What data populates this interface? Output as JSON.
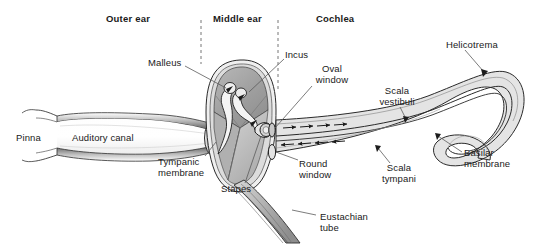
{
  "figure": {
    "type": "anatomical-diagram",
    "background_color": "#ffffff",
    "text_color": "#1a1a1a",
    "fill_light": "#e8e8e8",
    "fill_mid": "#c9c9c9",
    "fill_dark": "#9a9a9a",
    "stroke_color": "#2b2b2b"
  },
  "section_headers": [
    {
      "label": "Outer ear",
      "x": 137,
      "y": 14
    },
    {
      "label": "Middle ear",
      "x": 215,
      "y": 14
    },
    {
      "label": "Cochlea",
      "x": 313,
      "y": 14
    }
  ],
  "dividers": [
    {
      "name": "outer-middle-divider",
      "x": 201,
      "y1": 20,
      "y2": 64
    },
    {
      "name": "middle-inner-divider",
      "x": 278,
      "y1": 20,
      "y2": 90
    }
  ],
  "labels": [
    {
      "name": "pinna",
      "text": "Pinna",
      "x": 10,
      "y": 133,
      "align": "left"
    },
    {
      "name": "auditory-canal",
      "text": "Auditory canal",
      "x": 70,
      "y": 133,
      "align": "left"
    },
    {
      "name": "malleus",
      "text": "Malleus",
      "x": 150,
      "y": 61,
      "align": "left"
    },
    {
      "name": "tympanic-membrane",
      "text": "Tympanic\nmembrane",
      "x": 158,
      "y": 161,
      "align": "left"
    },
    {
      "name": "stapes",
      "text": "Stapes",
      "x": 224,
      "y": 187,
      "align": "left"
    },
    {
      "name": "incus",
      "text": "Incus",
      "x": 285,
      "y": 52,
      "align": "left"
    },
    {
      "name": "oval-window",
      "text": "Oval\nwindow",
      "x": 312,
      "y": 67,
      "align": "left"
    },
    {
      "name": "round-window",
      "text": "Round\nwindow",
      "x": 300,
      "y": 162,
      "align": "left"
    },
    {
      "name": "eustachian-tube",
      "text": "Eustachian\ntube",
      "x": 318,
      "y": 215,
      "align": "left"
    },
    {
      "name": "scala-vestibuli",
      "text": "Scala\nvestibuli",
      "x": 394,
      "y": 88,
      "align": "center"
    },
    {
      "name": "scala-tympani",
      "text": "Scala\ntympani",
      "x": 397,
      "y": 165,
      "align": "center"
    },
    {
      "name": "helicotrema",
      "text": "Helicotrema",
      "x": 447,
      "y": 42,
      "align": "left"
    },
    {
      "name": "basilar-membrane",
      "text": "Basilar\nmembrane",
      "x": 464,
      "y": 150,
      "align": "left"
    }
  ],
  "flow_arrows": {
    "scala_vestibuli_direction": "rightward",
    "scala_tympani_direction": "leftward",
    "vestibuli_arrow_count": 4,
    "tympani_arrow_count": 4
  },
  "parts": [
    "pinna",
    "auditory canal",
    "tympanic membrane",
    "malleus",
    "incus",
    "stapes",
    "oval window",
    "round window",
    "eustachian tube",
    "scala vestibuli",
    "scala tympani",
    "basilar membrane",
    "helicotrema"
  ]
}
